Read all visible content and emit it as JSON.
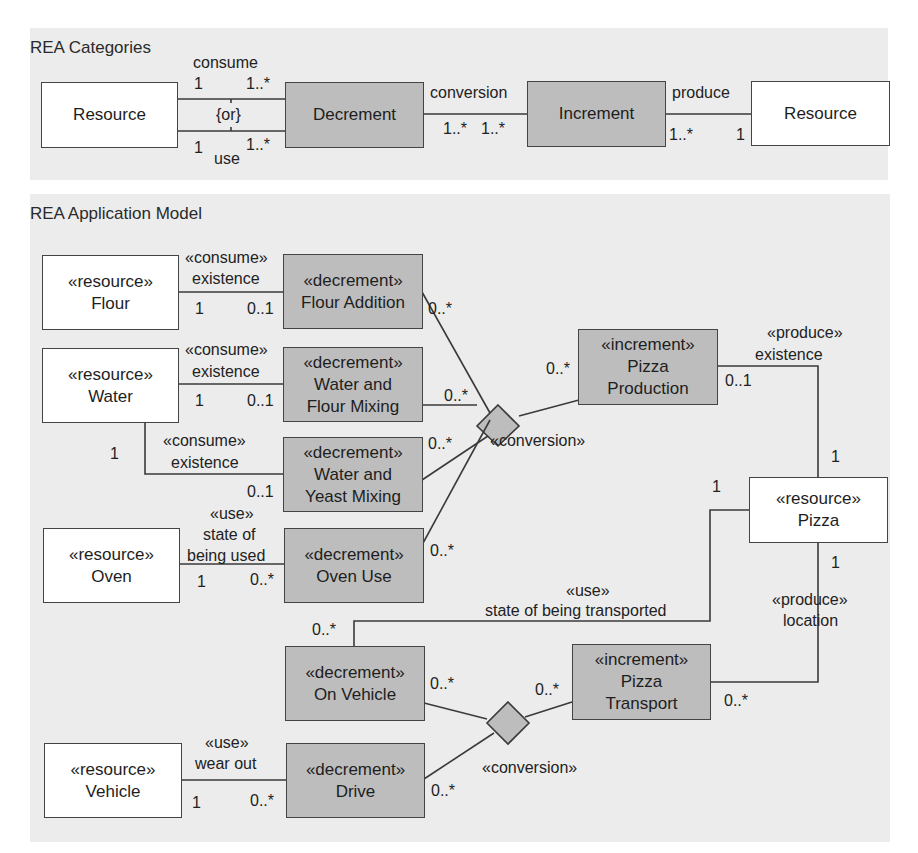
{
  "colors": {
    "panel_bg": "#ececec",
    "resource_fill": "#ffffff",
    "event_fill": "#bdbdbd",
    "line": "#3a3a3a"
  },
  "categories": {
    "title": "REA Categories",
    "boxes": {
      "resource_left": "Resource",
      "decrement": "Decrement",
      "increment": "Increment",
      "resource_right": "Resource"
    },
    "labels": {
      "consume": "consume",
      "use": "use",
      "or_constraint": "{or}",
      "conversion": "conversion",
      "produce": "produce"
    },
    "multiplicities": {
      "consume_res": "1",
      "consume_dec": "1..*",
      "use_res": "1",
      "use_dec": "1..*",
      "conv_dec": "1..*",
      "conv_inc": "1..*",
      "produce_inc": "1..*",
      "produce_res": "1"
    }
  },
  "application": {
    "title": "REA Application Model",
    "stereotypes": {
      "resource": "«resource»",
      "decrement": "«decrement»",
      "increment": "«increment»",
      "conversion": "«conversion»",
      "consume": "«consume»",
      "use": "«use»",
      "produce": "«produce»"
    },
    "resources": {
      "flour": "Flour",
      "water": "Water",
      "oven": "Oven",
      "vehicle": "Vehicle",
      "pizza": "Pizza"
    },
    "decrements": {
      "flour_addition": "Flour Addition",
      "water_flour_1": "Water and",
      "water_flour_2": "Flour Mixing",
      "water_yeast_1": "Water and",
      "water_yeast_2": "Yeast Mixing",
      "oven_use": "Oven Use",
      "on_vehicle": "On Vehicle",
      "drive": "Drive"
    },
    "increments": {
      "pizza_production_1": "Pizza",
      "pizza_production_2": "Production",
      "pizza_transport_1": "Pizza",
      "pizza_transport_2": "Transport"
    },
    "association_names": {
      "existence": "existence",
      "state_of": "state of",
      "being_used": "being used",
      "state_transported": "state of being transported",
      "wear_out": "wear out",
      "location": "location"
    },
    "multiplicities": {
      "one": "1",
      "zero_one": "0..1",
      "zero_many": "0..*"
    }
  }
}
